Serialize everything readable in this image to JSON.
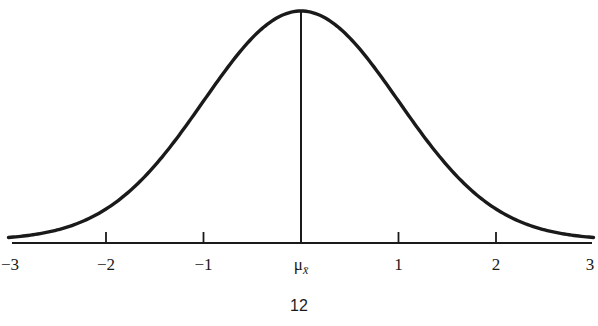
{
  "chart_data": {
    "type": "line",
    "title": "",
    "xlabel": "",
    "ylabel": "",
    "x_ticks": [
      -3,
      -2,
      -1,
      0,
      1,
      2,
      3
    ],
    "x_tick_labels": [
      "−3",
      "−2",
      "−1",
      "μ",
      "1",
      "2",
      "3"
    ],
    "center_label": {
      "main": "μ",
      "subscript": "x̄"
    },
    "xlim": [
      -3,
      3
    ],
    "ylim": [
      0,
      0.4
    ],
    "grid": false,
    "legend": null,
    "series": [
      {
        "name": "normal density",
        "x": [
          -3,
          -2.5,
          -2,
          -1.5,
          -1,
          -0.5,
          0,
          0.5,
          1,
          1.5,
          2,
          2.5,
          3
        ],
        "values": [
          0.0044,
          0.0175,
          0.054,
          0.1295,
          0.242,
          0.3521,
          0.3989,
          0.3521,
          0.242,
          0.1295,
          0.054,
          0.0175,
          0.0044
        ]
      }
    ],
    "annotations": [
      {
        "type": "vertical-line",
        "x": 0,
        "label": "mean"
      }
    ],
    "colors": {
      "curve": "#1a1a1a",
      "axis": "#1a1a1a"
    }
  },
  "page": {
    "number": "12"
  }
}
